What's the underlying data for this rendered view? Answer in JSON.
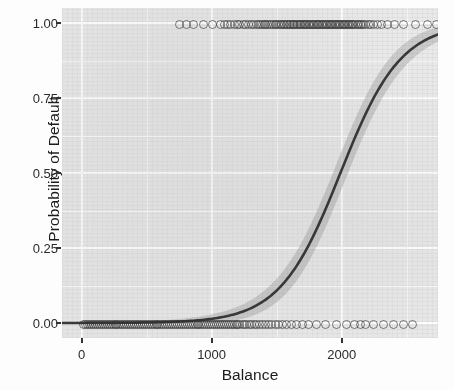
{
  "figure": {
    "name": "logistic-regression-probability-of-default-vs-balance",
    "top_clipped_title": ""
  },
  "axis": {
    "x_title": "Balance",
    "y_title": "Probability of Default"
  },
  "chart_data": {
    "type": "scatter",
    "title": "",
    "subtitle": "",
    "xlabel": "Balance",
    "ylabel": "Probability of Default",
    "xlim": [
      -150,
      2740
    ],
    "ylim": [
      -0.05,
      1.05
    ],
    "xticks": [
      0,
      1000,
      2000
    ],
    "xticklabels": [
      "0",
      "1000",
      "2000"
    ],
    "yticks": [
      0.0,
      0.25,
      0.5,
      0.75,
      1.0
    ],
    "yticklabels": [
      "0.00",
      "0.25",
      "0.50",
      "0.75",
      "1.00"
    ],
    "grid": true,
    "grid_minor": true,
    "legend": null,
    "legend_position": "none",
    "theme": "ggplot2-grey",
    "panel_background_color": "#e9e9e9",
    "gridline_color": "#ffffff",
    "point_color": "#333333",
    "point_shape": "open-circle",
    "point_alpha": 0.62,
    "line_color": "#3a3a3a",
    "confidence_band_color": "#9a9a9a",
    "series": [
      {
        "name": "default = 1 (defaulted)",
        "y_value": 1.0,
        "x_values": [
          745,
          800,
          850,
          930,
          1000,
          1060,
          1090,
          1115,
          1140,
          1165,
          1190,
          1210,
          1235,
          1255,
          1275,
          1295,
          1315,
          1335,
          1350,
          1365,
          1380,
          1395,
          1410,
          1425,
          1440,
          1455,
          1470,
          1480,
          1492,
          1505,
          1518,
          1530,
          1542,
          1555,
          1567,
          1578,
          1590,
          1600,
          1612,
          1622,
          1633,
          1644,
          1655,
          1665,
          1675,
          1685,
          1695,
          1705,
          1715,
          1725,
          1735,
          1745,
          1755,
          1765,
          1775,
          1785,
          1795,
          1805,
          1815,
          1825,
          1835,
          1845,
          1855,
          1865,
          1875,
          1885,
          1895,
          1905,
          1915,
          1925,
          1935,
          1945,
          1955,
          1965,
          1975,
          1985,
          1995,
          2005,
          2015,
          2025,
          2035,
          2045,
          2055,
          2065,
          2075,
          2085,
          2098,
          2110,
          2122,
          2135,
          2148,
          2162,
          2178,
          2195,
          2215,
          2240,
          2268,
          2300,
          2345,
          2400,
          2470,
          2560,
          2650,
          2720
        ]
      },
      {
        "name": "default = 0 (no default)",
        "y_value": 0.0,
        "x_values": [
          10,
          25,
          40,
          55,
          70,
          85,
          100,
          115,
          130,
          145,
          160,
          175,
          190,
          205,
          220,
          235,
          250,
          265,
          280,
          295,
          310,
          325,
          340,
          355,
          370,
          385,
          400,
          415,
          430,
          445,
          460,
          475,
          490,
          505,
          520,
          535,
          550,
          565,
          580,
          595,
          610,
          625,
          640,
          655,
          670,
          685,
          700,
          715,
          730,
          745,
          760,
          775,
          790,
          805,
          820,
          835,
          850,
          865,
          880,
          895,
          910,
          925,
          940,
          955,
          970,
          985,
          1000,
          1015,
          1030,
          1045,
          1060,
          1075,
          1090,
          1105,
          1120,
          1135,
          1150,
          1165,
          1180,
          1195,
          1210,
          1228,
          1245,
          1262,
          1280,
          1300,
          1320,
          1340,
          1360,
          1382,
          1405,
          1430,
          1455,
          1480,
          1508,
          1538,
          1570,
          1605,
          1645,
          1690,
          1740,
          1800,
          1870,
          1950,
          2030,
          2090,
          2135,
          2175,
          2240,
          2310,
          2390,
          2470,
          2540
        ]
      }
    ],
    "fit": {
      "name": "logistic-fit",
      "model": "glm binomial logit",
      "midpoint_x": 1990,
      "slope_k": 0.0043,
      "description": "Sigmoid rising from ~0 near Balance 500 to ~1 near Balance 2600"
    }
  }
}
